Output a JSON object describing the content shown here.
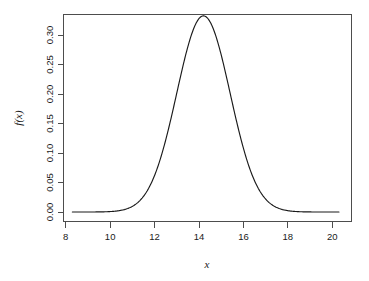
{
  "chart_data": {
    "type": "line",
    "title": "",
    "subtitle": "",
    "xlabel": "x",
    "ylabel": "f(x)",
    "xlim": [
      8.0,
      20.6
    ],
    "ylim": [
      0.0,
      0.335
    ],
    "grid": false,
    "legend": null,
    "annotations": [],
    "distribution": {
      "family": "normal",
      "mean": 14.2,
      "sd": 1.2,
      "peak_x": 14.2,
      "peak_y": 0.3324
    },
    "xticks": [
      8,
      10,
      12,
      14,
      16,
      18,
      20
    ],
    "xtick_labels": [
      "8",
      "10",
      "12",
      "14",
      "16",
      "18",
      "20"
    ],
    "yticks": [
      0.0,
      0.05,
      0.1,
      0.15,
      0.2,
      0.25,
      0.3
    ],
    "ytick_labels": [
      "0.00",
      "0.05",
      "0.10",
      "0.15",
      "0.20",
      "0.25",
      "0.30"
    ],
    "series": [
      {
        "name": "f(x)",
        "color": "#1a1a1a",
        "x": [
          8.3,
          8.6,
          8.9,
          9.2,
          9.5,
          9.8,
          10.1,
          10.4,
          10.7,
          11.0,
          11.3,
          11.6,
          11.9,
          12.2,
          12.5,
          12.8,
          13.1,
          13.4,
          13.7,
          14.0,
          14.2,
          14.5,
          14.8,
          15.1,
          15.4,
          15.7,
          16.0,
          16.3,
          16.6,
          16.9,
          17.2,
          17.5,
          17.8,
          18.1,
          18.4,
          18.7,
          19.0,
          19.3,
          19.6,
          19.9,
          20.2
        ],
        "y": [
          0.0,
          0.0,
          0.0,
          0.0001,
          0.0001,
          0.0003,
          0.0007,
          0.0016,
          0.0033,
          0.0065,
          0.012,
          0.0208,
          0.0337,
          0.0513,
          0.0733,
          0.0983,
          0.1239,
          0.1468,
          0.1637,
          0.1717,
          0.3324,
          0.3243,
          0.2912,
          0.2372,
          0.1746,
          0.1151,
          0.0672,
          0.0347,
          0.0158,
          0.0064,
          0.0023,
          0.0007,
          0.0002,
          0.0001,
          0.0,
          0.0,
          0.0,
          0.0,
          0.0,
          0.0,
          0.0
        ]
      }
    ],
    "axis_color": "#4d4d4d",
    "background": "#ffffff"
  },
  "axes": {
    "x_title": "x",
    "y_title": "f(x)",
    "x_tick_labels": [
      "8",
      "10",
      "12",
      "14",
      "16",
      "18",
      "20"
    ],
    "y_tick_labels": [
      "0.00",
      "0.05",
      "0.10",
      "0.15",
      "0.20",
      "0.25",
      "0.30"
    ]
  }
}
